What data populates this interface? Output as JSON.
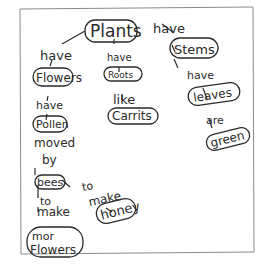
{
  "diagram": {
    "nodes": {
      "plants": "Plants",
      "flowers": "Flowers",
      "roots": "Roots",
      "stems": "Stems",
      "pollen": "Pollen",
      "carrots": "Carrits",
      "leaves": "leaves",
      "green": "green",
      "bees": "bees",
      "honey": "honey",
      "more_flowers_1": "mor",
      "more_flowers_2": "Flowers"
    },
    "links": {
      "plants_flowers": "have",
      "plants_roots": "have",
      "plants_stems": "have",
      "flowers_pollen": "have",
      "roots_carrots": "like",
      "stems_leaves": "have",
      "leaves_green": "are",
      "pollen_bees_1": "moved",
      "pollen_bees_2": "by",
      "bees_honey_1": "to",
      "bees_honey_2": "make",
      "bees_more_1": "to",
      "bees_more_2": "make"
    }
  }
}
